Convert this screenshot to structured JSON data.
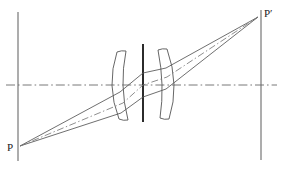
{
  "diagram": {
    "type": "optical-ray-diagram",
    "canvas": {
      "width": 283,
      "height": 169,
      "background": "#ffffff"
    },
    "colors": {
      "ink": "#3a3a3a",
      "ink_dark": "#2b2b2b",
      "axis": "#6a6a6a",
      "ray": "#555555",
      "chain": "#777777",
      "label": "#1a1a1a"
    },
    "labels": {
      "object_point": "P",
      "image_point": "P′"
    },
    "object_point": {
      "label": "P",
      "x": 20,
      "y": 146,
      "label_x": 9,
      "label_y": 150
    },
    "image_point": {
      "label": "P′",
      "x": 258,
      "y": 17,
      "label_x": 264,
      "label_y": 14
    },
    "optical_axis": {
      "name": "optical-axis",
      "style": "dash-dot",
      "y": 85,
      "x_start": 6,
      "x_end": 277
    },
    "object_plane": {
      "name": "object-plane",
      "style": "solid",
      "x": 18,
      "y_top": 12,
      "y_bottom": 161
    },
    "image_plane": {
      "name": "image-plane",
      "style": "solid",
      "x": 261,
      "y_top": 10,
      "y_bottom": 160
    },
    "aperture_stop": {
      "name": "aperture-stop",
      "x": 143,
      "y_top": 44,
      "y_bottom": 122,
      "width": 2
    },
    "lenses": [
      {
        "name": "left-lens",
        "kind": "meniscus",
        "front_top": {
          "x": 117,
          "y": 52
        },
        "front_bottom": {
          "x": 119,
          "y": 119
        },
        "front_bulge": -11,
        "back_top": {
          "x": 126,
          "y": 51
        },
        "back_bottom": {
          "x": 128,
          "y": 120
        },
        "back_bulge": -7
      },
      {
        "name": "right-lens",
        "kind": "meniscus",
        "front_top": {
          "x": 158,
          "y": 50
        },
        "front_bottom": {
          "x": 160,
          "y": 118
        },
        "front_bulge": 7,
        "back_top": {
          "x": 167,
          "y": 49
        },
        "back_bottom": {
          "x": 169,
          "y": 119
        },
        "back_bulge": 11
      }
    ],
    "rays": [
      {
        "name": "upper-marginal-ray",
        "style": "solid",
        "points": "20,146 120,92 166,68 258,17"
      },
      {
        "name": "lower-marginal-ray",
        "style": "solid",
        "points": "20,146 121,113 166,89 258,17"
      },
      {
        "name": "chief-ray",
        "style": "dash-dot",
        "points": "20,146 123,103 143,85 167,77 258,17"
      }
    ],
    "internal_segments": [
      {
        "name": "internal-ray-upper",
        "style": "solid",
        "points": "120,92 143,73 166,68"
      },
      {
        "name": "internal-ray-lower",
        "style": "solid",
        "points": "121,113 143,97 166,89"
      }
    ]
  }
}
